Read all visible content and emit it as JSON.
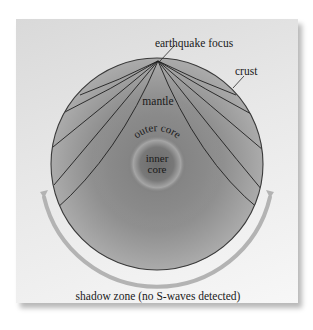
{
  "diagram": {
    "labels": {
      "focus": "earthquake focus",
      "crust": "crust",
      "mantle": "mantle",
      "outer_core": "outer core",
      "inner_core_line1": "inner",
      "inner_core_line2": "core",
      "shadow_zone": "shadow zone (no S-waves detected)"
    },
    "colors": {
      "panel_bg": "#e6e6e6",
      "mantle": "#9a9a9a",
      "outer_core": "#7d7d7d",
      "inner_core": "#6e6e6e",
      "ray_lines": "#1f1f1f",
      "shadow_arrow": "#b5b5b5"
    }
  }
}
